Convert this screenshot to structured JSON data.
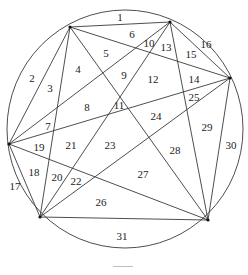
{
  "diagram": {
    "type": "circle-with-inscribed-hexagon-complete-graph",
    "circle": {
      "cx": 125,
      "cy": 129,
      "rx": 118,
      "ry": 119
    },
    "vertices": [
      {
        "id": "A",
        "x": 70,
        "y": 27
      },
      {
        "id": "B",
        "x": 170,
        "y": 22
      },
      {
        "id": "C",
        "x": 230,
        "y": 78
      },
      {
        "id": "D",
        "x": 208,
        "y": 220
      },
      {
        "id": "E",
        "x": 40,
        "y": 217
      },
      {
        "id": "F",
        "x": 9,
        "y": 144
      }
    ],
    "region_count": 31,
    "labels": [
      {
        "text": "1",
        "x": 120,
        "y": 17
      },
      {
        "text": "2",
        "x": 32,
        "y": 78
      },
      {
        "text": "3",
        "x": 50,
        "y": 88
      },
      {
        "text": "4",
        "x": 78,
        "y": 69
      },
      {
        "text": "5",
        "x": 106,
        "y": 53
      },
      {
        "text": "6",
        "x": 132,
        "y": 34
      },
      {
        "text": "7",
        "x": 48,
        "y": 126
      },
      {
        "text": "8",
        "x": 87,
        "y": 107
      },
      {
        "text": "9",
        "x": 124,
        "y": 75
      },
      {
        "text": "10",
        "x": 149,
        "y": 43
      },
      {
        "text": "11",
        "x": 119,
        "y": 105
      },
      {
        "text": "12",
        "x": 153,
        "y": 79
      },
      {
        "text": "13",
        "x": 166,
        "y": 47
      },
      {
        "text": "14",
        "x": 194,
        "y": 79
      },
      {
        "text": "15",
        "x": 191,
        "y": 54
      },
      {
        "text": "16",
        "x": 206,
        "y": 44
      },
      {
        "text": "17",
        "x": 15,
        "y": 186
      },
      {
        "text": "18",
        "x": 34,
        "y": 172
      },
      {
        "text": "19",
        "x": 39,
        "y": 147
      },
      {
        "text": "20",
        "x": 57,
        "y": 177
      },
      {
        "text": "21",
        "x": 71,
        "y": 145
      },
      {
        "text": "22",
        "x": 76,
        "y": 181
      },
      {
        "text": "23",
        "x": 110,
        "y": 145
      },
      {
        "text": "24",
        "x": 156,
        "y": 116
      },
      {
        "text": "25",
        "x": 194,
        "y": 97
      },
      {
        "text": "26",
        "x": 101,
        "y": 202
      },
      {
        "text": "27",
        "x": 143,
        "y": 174
      },
      {
        "text": "28",
        "x": 175,
        "y": 150
      },
      {
        "text": "29",
        "x": 207,
        "y": 127
      },
      {
        "text": "30",
        "x": 231,
        "y": 145
      },
      {
        "text": "31",
        "x": 122,
        "y": 236
      }
    ]
  }
}
